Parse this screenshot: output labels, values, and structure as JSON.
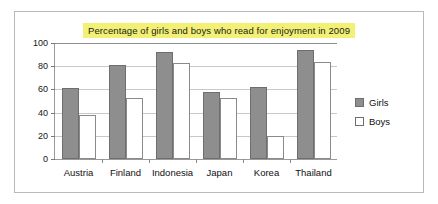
{
  "chart_data": {
    "type": "bar",
    "title": "Percentage of girls and boys who read for enjoyment in 2009",
    "xlabel": "",
    "ylabel": "",
    "categories": [
      "Austria",
      "Finland",
      "Indonesia",
      "Japan",
      "Korea",
      "Thailand"
    ],
    "series": [
      {
        "name": "Girls",
        "values": [
          61,
          81,
          92,
          58,
          62,
          94
        ],
        "color": "#8e8e8e"
      },
      {
        "name": "Boys",
        "values": [
          38,
          53,
          83,
          53,
          20,
          84
        ],
        "color": "#ffffff"
      }
    ],
    "ylim": [
      0,
      100
    ],
    "yticks": [
      0,
      20,
      40,
      60,
      80,
      100
    ],
    "ytick_labels": [
      "0",
      "20",
      "40",
      "60",
      "80",
      "100"
    ],
    "grid": true,
    "legend_position": "right",
    "title_highlight_color": "#f2f075"
  }
}
